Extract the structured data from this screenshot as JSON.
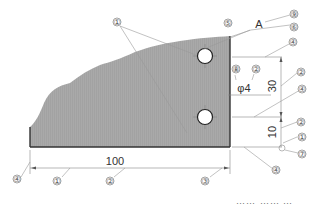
{
  "figure": {
    "type": "engineering-drawing",
    "part_fill_color": "#a7a7a7",
    "outline_color": "#333333",
    "dimensions": {
      "overall_length": "100",
      "hole_spacing": "30",
      "hole_offset": "10",
      "hole_diameter": "φ4"
    },
    "view_label": "A",
    "callouts": [
      {
        "id": "c1a",
        "label": "①"
      },
      {
        "id": "c9",
        "label": "⑨"
      },
      {
        "id": "c5",
        "label": "⑤"
      },
      {
        "id": "c6",
        "label": "⑥"
      },
      {
        "id": "c4a",
        "label": "④"
      },
      {
        "id": "c8",
        "label": "⑧"
      },
      {
        "id": "c2a",
        "label": "②"
      },
      {
        "id": "c2b",
        "label": "②"
      },
      {
        "id": "c4b",
        "label": "④"
      },
      {
        "id": "c2c",
        "label": "②"
      },
      {
        "id": "c1b",
        "label": "①"
      },
      {
        "id": "c7",
        "label": "⑦"
      },
      {
        "id": "c4c",
        "label": "④"
      },
      {
        "id": "c4d",
        "label": "④"
      },
      {
        "id": "c1c",
        "label": "①"
      },
      {
        "id": "c2d",
        "label": "②"
      },
      {
        "id": "c3",
        "label": "③"
      }
    ],
    "caption_partial": "⋯⋯ ⋯⋯ ⋯"
  }
}
